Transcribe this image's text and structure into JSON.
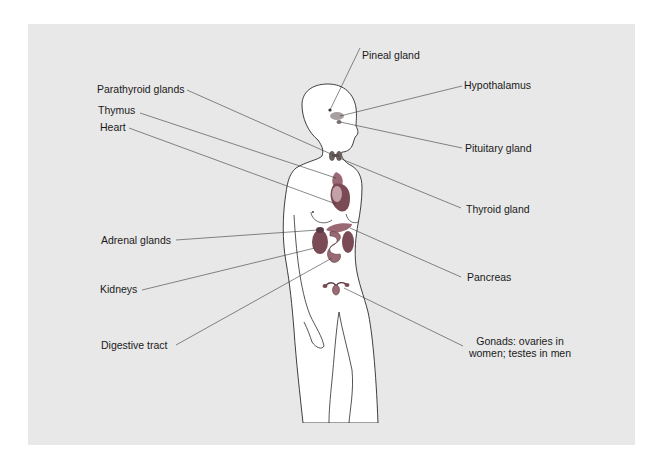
{
  "diagram": {
    "colors": {
      "background_panel": "#e8e8e8",
      "body_fill": "#ffffff",
      "outline": "#2a2a2a",
      "leader_line": "#3a3a3a",
      "organ_dark": "#7a4a55",
      "organ_mid": "#9a6a74",
      "organ_light": "#c4a0a8",
      "brain_gland": "#a8a0a0"
    },
    "labels_left": [
      {
        "id": "parathyroid",
        "text": "Parathyroid glands"
      },
      {
        "id": "thymus",
        "text": "Thymus"
      },
      {
        "id": "heart",
        "text": "Heart"
      },
      {
        "id": "adrenal",
        "text": "Adrenal glands"
      },
      {
        "id": "kidneys",
        "text": "Kidneys"
      },
      {
        "id": "digestive",
        "text": "Digestive tract"
      }
    ],
    "labels_right": [
      {
        "id": "pineal",
        "text": "Pineal gland"
      },
      {
        "id": "hypothalamus",
        "text": "Hypothalamus"
      },
      {
        "id": "pituitary",
        "text": "Pituitary gland"
      },
      {
        "id": "thyroid",
        "text": "Thyroid gland"
      },
      {
        "id": "pancreas",
        "text": "Pancreas"
      },
      {
        "id": "gonads",
        "text": "Gonads: ovaries in women; testes in men"
      }
    ]
  }
}
